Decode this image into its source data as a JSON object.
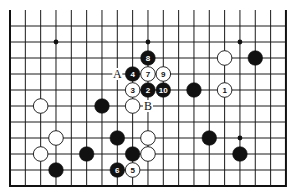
{
  "diagram": {
    "type": "go-board-fragment",
    "grid": {
      "columns": 19,
      "rows": 11,
      "origin_x": 10,
      "origin_y": 26,
      "spacing_x": 15.33,
      "spacing_y": 16,
      "top_open": true,
      "open_top_y": 10,
      "line_color": "#1a1a1a",
      "edge_color": "#111111"
    },
    "star_points": [
      {
        "c": 3,
        "r": 1
      },
      {
        "c": 9,
        "r": 1
      },
      {
        "c": 15,
        "r": 1
      },
      {
        "c": 3,
        "r": 7
      },
      {
        "c": 9,
        "r": 7
      },
      {
        "c": 15,
        "r": 7
      }
    ],
    "stones": [
      {
        "color": "black",
        "c": 9,
        "r": 2,
        "label": "8"
      },
      {
        "color": "black",
        "c": 8,
        "r": 3,
        "label": "4"
      },
      {
        "color": "white",
        "c": 9,
        "r": 3,
        "label": "7"
      },
      {
        "color": "white",
        "c": 10,
        "r": 3,
        "label": "9"
      },
      {
        "color": "white",
        "c": 8,
        "r": 4,
        "label": "3"
      },
      {
        "color": "black",
        "c": 9,
        "r": 4,
        "label": "2"
      },
      {
        "color": "black",
        "c": 10,
        "r": 4,
        "label": "10"
      },
      {
        "color": "black",
        "c": 12,
        "r": 4,
        "label": ""
      },
      {
        "color": "white",
        "c": 14,
        "r": 4,
        "label": "1"
      },
      {
        "color": "white",
        "c": 14,
        "r": 2,
        "label": ""
      },
      {
        "color": "black",
        "c": 16,
        "r": 2,
        "label": ""
      },
      {
        "color": "white",
        "c": 2,
        "r": 5,
        "label": ""
      },
      {
        "color": "black",
        "c": 6,
        "r": 5,
        "label": ""
      },
      {
        "color": "white",
        "c": 8,
        "r": 5,
        "label": ""
      },
      {
        "color": "white",
        "c": 3,
        "r": 7,
        "label": ""
      },
      {
        "color": "black",
        "c": 7,
        "r": 7,
        "label": ""
      },
      {
        "color": "white",
        "c": 9,
        "r": 7,
        "label": ""
      },
      {
        "color": "black",
        "c": 13,
        "r": 7,
        "label": ""
      },
      {
        "color": "white",
        "c": 2,
        "r": 8,
        "label": ""
      },
      {
        "color": "black",
        "c": 5,
        "r": 8,
        "label": ""
      },
      {
        "color": "black",
        "c": 8,
        "r": 8,
        "label": ""
      },
      {
        "color": "white",
        "c": 9,
        "r": 8,
        "label": ""
      },
      {
        "color": "black",
        "c": 15,
        "r": 8,
        "label": ""
      },
      {
        "color": "black",
        "c": 3,
        "r": 9,
        "label": ""
      },
      {
        "color": "black",
        "c": 7,
        "r": 9,
        "label": "6"
      },
      {
        "color": "white",
        "c": 8,
        "r": 9,
        "label": "5"
      }
    ],
    "markers": [
      {
        "text": "A",
        "c": 7,
        "r": 3
      },
      {
        "text": "B",
        "c": 9,
        "r": 5
      }
    ]
  }
}
